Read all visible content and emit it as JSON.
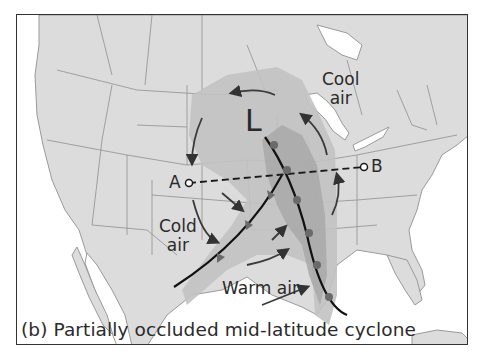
{
  "figure": {
    "caption": "(b) Partially occluded mid-latitude cyclone",
    "low_pressure_symbol": "L",
    "labels": {
      "cool_air": [
        "Cool",
        "air"
      ],
      "cold_air": [
        "Cold",
        "air"
      ],
      "warm_air": "Warm air",
      "point_a": "A",
      "point_b": "B"
    },
    "colors": {
      "land": "#dcdcdc",
      "water": "#ffffff",
      "borders": "#8a8a8a",
      "precip_light": "#bdbdbd",
      "precip_dark": "#a8a8a8",
      "front_line": "#1a1a1a",
      "arrows": "#3a3a3a"
    },
    "elements": [
      {
        "type": "low-pressure-center",
        "label": "L"
      },
      {
        "type": "cold-front",
        "description": "curved line from L southwest to Texas"
      },
      {
        "type": "occluded-front",
        "description": "short segment near L"
      },
      {
        "type": "warm-front",
        "description": "line from L south to Gulf of Mexico"
      },
      {
        "type": "cross-section-line",
        "from": "A",
        "to": "B",
        "style": "dashed"
      },
      {
        "type": "airflow-arrows",
        "count": 8
      }
    ]
  }
}
